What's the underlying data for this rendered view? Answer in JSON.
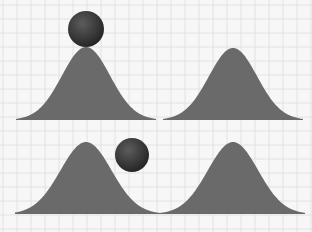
{
  "diagram": {
    "colors": {
      "background": "#f7f7f7",
      "grid": "#e2e2e2",
      "hill": "#6a6a6a",
      "ball_light": "#5a5a5a",
      "ball_dark": "#262626"
    },
    "grid": {
      "spacing": 14
    },
    "panels": [
      {
        "id": "top-left",
        "hill": {
          "center_x": 86,
          "peak_y": 47,
          "base_y": 120,
          "x_start": 16,
          "x_end": 156
        },
        "ball": {
          "cx": 86,
          "cy": 29,
          "r": 18,
          "position": "on-peak"
        }
      },
      {
        "id": "top-right",
        "hill": {
          "center_x": 233,
          "peak_y": 48,
          "base_y": 120,
          "x_start": 163,
          "x_end": 303
        }
      },
      {
        "id": "bottom-left",
        "hill": {
          "center_x": 86,
          "peak_y": 142,
          "base_y": 214,
          "x_start": 15,
          "x_end": 160
        },
        "ball": {
          "cx": 132,
          "cy": 155,
          "r": 17,
          "position": "on-slope"
        }
      },
      {
        "id": "bottom-right",
        "hill": {
          "center_x": 233,
          "peak_y": 142,
          "base_y": 214,
          "x_start": 160,
          "x_end": 305
        }
      }
    ]
  }
}
